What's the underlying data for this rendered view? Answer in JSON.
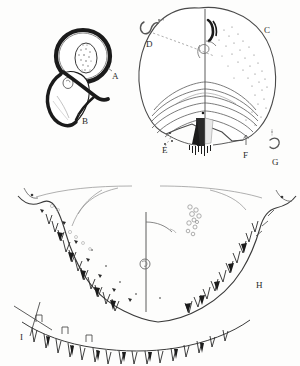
{
  "plate": {
    "title": "Morphological plate",
    "background_color": "#fdfdfc",
    "ink_color": "#1d1d1d",
    "light_ink_color": "#5a5a5a",
    "faint_ink_color": "#8e8e8e",
    "width": 300,
    "height": 366
  },
  "labels": [
    {
      "id": "A",
      "text": "A",
      "x": 112,
      "y": 72,
      "panel": "upper-left",
      "describes": "ring-shaped structure with stippled inner oval"
    },
    {
      "id": "B",
      "text": "B",
      "x": 82,
      "y": 117,
      "panel": "upper-left",
      "describes": "teardrop-shaped structure with dark margin"
    },
    {
      "id": "C",
      "text": "C",
      "x": 264,
      "y": 26,
      "panel": "upper-right",
      "describes": "dorsal body outline with concentric striations"
    },
    {
      "id": "D",
      "text": "D",
      "x": 146,
      "y": 40,
      "panel": "upper-right",
      "describes": "detached hook-shaped seta, dashed leader line"
    },
    {
      "id": "E",
      "text": "E",
      "x": 162,
      "y": 146,
      "panel": "upper-right",
      "describes": "left lateral point, dashed leader line"
    },
    {
      "id": "F",
      "text": "F",
      "x": 243,
      "y": 151,
      "panel": "upper-right",
      "describes": "posterior right margin, arrow leader"
    },
    {
      "id": "G",
      "text": "G",
      "x": 272,
      "y": 158,
      "panel": "upper-right",
      "describes": "outer posterior seta, dashed leader"
    },
    {
      "id": "H",
      "text": "H",
      "x": 256,
      "y": 281,
      "panel": "lower",
      "describes": "right denticle series"
    },
    {
      "id": "I",
      "text": "I",
      "x": 20,
      "y": 333,
      "panel": "lower",
      "describes": "left marginal seta and denticle series"
    }
  ],
  "panels": [
    {
      "name": "panel-a-b",
      "label_ids": [
        "A",
        "B"
      ],
      "description": "Two adjoining rounded structures drawn in dense stipple; upper is an oval ring enclosing a stippled ovum, lower is a teardrop outline."
    },
    {
      "name": "panel-c",
      "label_ids": [
        "C",
        "D",
        "E",
        "F",
        "G"
      ],
      "description": "Dorsal shield outline, bilaterally symmetrical about a vertical midline, with concentric posterior striae, punctate stippling on the right half and a dark median posterior patch."
    },
    {
      "name": "panel-h-i",
      "label_ids": [
        "H",
        "I"
      ],
      "description": "Large ventral margin arc bearing a series of triangular denticles, marginal setae, a median vertical line with a circular organ, and a cluster of small open circles."
    }
  ]
}
